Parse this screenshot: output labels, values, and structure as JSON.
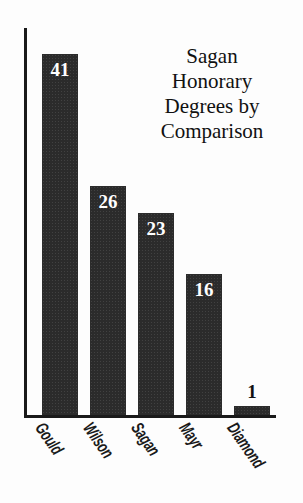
{
  "chart_data": {
    "type": "bar",
    "title": "Sagan\nHonorary\nDegrees by\nComparison",
    "title_lines": [
      "Sagan",
      "Honorary",
      "Degrees by",
      "Comparison"
    ],
    "xlabel": "",
    "ylabel": "",
    "categories": [
      "Gould",
      "Wilson",
      "Sagan",
      "Mayr",
      "Diamond"
    ],
    "values": [
      41,
      26,
      23,
      16,
      1
    ],
    "value_labels": [
      "41",
      "26",
      "23",
      "16",
      "1"
    ],
    "ylim": [
      0,
      44
    ],
    "grid": false,
    "legend": false,
    "axes": "left-and-bottom-spines-only",
    "bar_color": "#2b2b2b",
    "background_color": "#fdfdfd",
    "inside_label_color": "#ffffff",
    "outside_label_color": "#111111",
    "label_rotation_degrees": -55
  },
  "bars": [
    {
      "category": "Gould",
      "value": 41,
      "label": "41",
      "label_position": "inside"
    },
    {
      "category": "Wilson",
      "value": 26,
      "label": "26",
      "label_position": "inside"
    },
    {
      "category": "Sagan",
      "value": 23,
      "label": "23",
      "label_position": "inside"
    },
    {
      "category": "Mayr",
      "value": 16,
      "label": "16",
      "label_position": "inside"
    },
    {
      "category": "Diamond",
      "value": 1,
      "label": "1",
      "label_position": "outside"
    }
  ]
}
